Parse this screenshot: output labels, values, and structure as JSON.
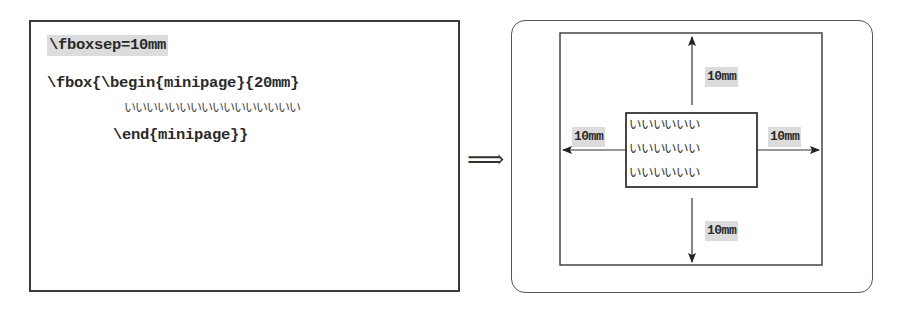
{
  "left_panel": {
    "code_lines": [
      "\\fboxsep=10mm",
      "\\fbox{\\begin{minipage}{20mm}",
      "いいいいいいいいいいいいいいいい",
      "\\end{minipage}}"
    ],
    "highlighted_line_index": 0
  },
  "transition": {
    "arrow_symbol": "⟹"
  },
  "right_panel": {
    "content_lines": [
      "いいいいいい",
      "いいいいいい",
      "いいいいいい"
    ],
    "labels": {
      "top": "10mm",
      "left": "10mm",
      "right": "10mm",
      "bottom": "10mm"
    }
  },
  "colors": {
    "border": "#3a3a3a",
    "highlight": "#dcdcdc",
    "text": "#2a2a2a"
  }
}
